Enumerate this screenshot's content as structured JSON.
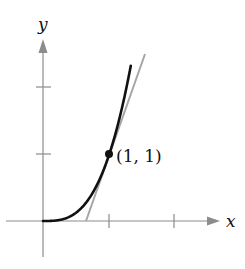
{
  "diagram": {
    "function": "y = x^3",
    "tangent_line": "y = 3x - 2",
    "point_label": "(1, 1)",
    "x_axis_label": "x",
    "y_axis_label": "y",
    "x_ticks": [
      1,
      2
    ],
    "y_ticks": [
      1,
      2
    ],
    "colors": {
      "curve": "#111111",
      "tangent": "#a6a6a6",
      "axes": "#8c8c8c"
    }
  }
}
